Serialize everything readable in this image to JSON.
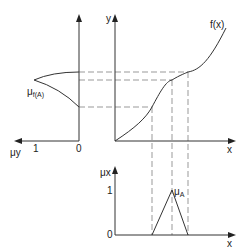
{
  "diagram": {
    "top_right_plot": {
      "y_axis_label": "y",
      "x_axis_label": "x",
      "curve_label": "f(x)"
    },
    "left_plot": {
      "horizontal_axis_label": "μy",
      "curve_label_main": "μ",
      "curve_label_sub": "f(A)",
      "tick_one": "1",
      "tick_zero": "0"
    },
    "bottom_plot": {
      "vertical_axis_label": "μx",
      "x_axis_label": "x",
      "tick_one": "1",
      "tick_zero": "0",
      "set_label_main": "μ",
      "set_label_sub": "A"
    },
    "colors": {
      "lines": "#333333",
      "dashed": "#999999",
      "background": "#ffffff"
    }
  }
}
